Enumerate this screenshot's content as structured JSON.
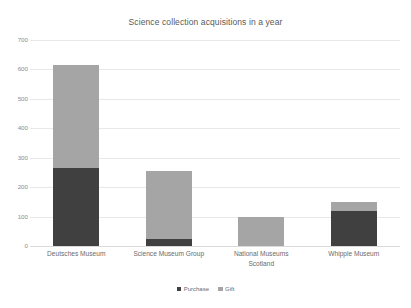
{
  "chart_data": {
    "type": "bar",
    "subtype": "stacked-column",
    "title": "Science collection acquisitions in a year",
    "xlabel": "",
    "ylabel": "",
    "ylim": [
      0,
      700
    ],
    "ytick_step": 100,
    "yticks": [
      "0",
      "100",
      "200",
      "300",
      "400",
      "500",
      "600",
      "700"
    ],
    "grid": true,
    "legend_position": "bottom",
    "categories": [
      "Deutsches Museum",
      "Science Museum Group",
      "National Museums Scotland",
      "Whipple Museum"
    ],
    "category_lines": [
      [
        "Deutsches Museum"
      ],
      [
        "Science Museum Group"
      ],
      [
        "National Museums",
        "Scotland"
      ],
      [
        "Whipple Museum"
      ]
    ],
    "series": [
      {
        "name": "Purchase",
        "color": "#404040",
        "values": [
          265,
          25,
          0,
          118
        ]
      },
      {
        "name": "Gift",
        "color": "#a5a5a5",
        "values": [
          350,
          230,
          98,
          32
        ]
      }
    ],
    "totals": [
      615,
      255,
      98,
      150
    ]
  },
  "legend": {
    "items": [
      {
        "label": "Purchase",
        "color": "#404040"
      },
      {
        "label": "Gift",
        "color": "#a5a5a5"
      }
    ]
  },
  "colors": {
    "purchase": "#404040",
    "gift": "#a5a5a5",
    "gridline": "#e8e8e8",
    "baseline": "#d9d9d9",
    "text": "#595959",
    "tick_text": "#8c8c8c",
    "background": "#ffffff"
  }
}
